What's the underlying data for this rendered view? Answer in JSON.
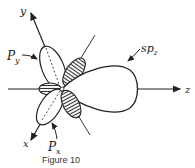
{
  "figure": {
    "caption": "Figure 10",
    "axes": {
      "x": "x",
      "y": "y",
      "z": "z"
    },
    "orbitals": [
      {
        "label": "P",
        "subscript": "y",
        "name": "p-y orbital"
      },
      {
        "label": "P",
        "subscript": "x",
        "name": "p-x orbital"
      },
      {
        "label": "sp",
        "subscript": "z",
        "name": "sp-z hybrid orbital"
      }
    ],
    "colors": {
      "line": "#222222",
      "hatch": "#333333",
      "background": "#ffffff"
    }
  }
}
